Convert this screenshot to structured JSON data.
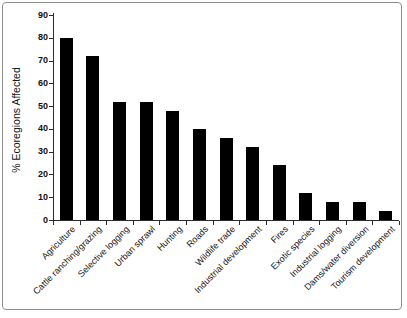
{
  "chart_data": {
    "type": "bar",
    "title": "",
    "xlabel": "",
    "ylabel": "% Ecoregions Affected",
    "ylim": [
      0,
      90
    ],
    "ytick_interval": 10,
    "yticks": [
      0,
      10,
      20,
      30,
      40,
      50,
      60,
      70,
      80,
      90
    ],
    "categories": [
      "Agriculture",
      "Cattle ranching/grazing",
      "Selective logging",
      "Urban sprawl",
      "Hunting",
      "Roads",
      "Wildlife trade",
      "Industrial development",
      "Fires",
      "Exotic species",
      "Industrial logging",
      "Dams/water diversion",
      "Tourism development"
    ],
    "values": [
      80,
      72,
      52,
      52,
      48,
      40,
      36,
      32,
      24,
      12,
      8,
      8,
      4
    ],
    "grid": "off",
    "legend_position": "none",
    "bar_color": "#000000",
    "axis_color": "#2b2b2b",
    "frame_border_color": "#8d8d8d",
    "background_color": "#ffffff"
  }
}
